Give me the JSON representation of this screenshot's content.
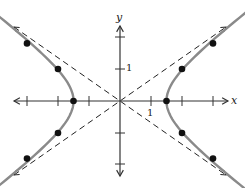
{
  "diagram": {
    "type": "hyperbola-graph",
    "equation_form": "x^2/a^2 - y^2/b^2 = 1",
    "axes": {
      "x_label": "x",
      "y_label": "y",
      "x_tick_label": "1",
      "y_tick_label": "1",
      "x_ticks": [
        -3,
        -2,
        -1,
        1,
        2,
        3
      ],
      "y_ticks": [
        -2,
        -1,
        1,
        2
      ]
    },
    "vertices": [
      [
        -1.5,
        0
      ],
      [
        1.5,
        0
      ]
    ],
    "plotted_points": [
      [
        -3,
        1.8
      ],
      [
        -2,
        1
      ],
      [
        -1.5,
        0
      ],
      [
        -2,
        -1
      ],
      [
        -3,
        -1.8
      ],
      [
        3,
        1.8
      ],
      [
        2,
        1
      ],
      [
        1.5,
        0
      ],
      [
        2,
        -1
      ],
      [
        3,
        -1.8
      ]
    ],
    "asymptotes": [
      "y = (2/3)x",
      "y = -(2/3)x"
    ],
    "colors": {
      "curve": "#8a8a8a",
      "axes": "#333333",
      "asymptote": "#222222",
      "points": "#111111"
    }
  }
}
